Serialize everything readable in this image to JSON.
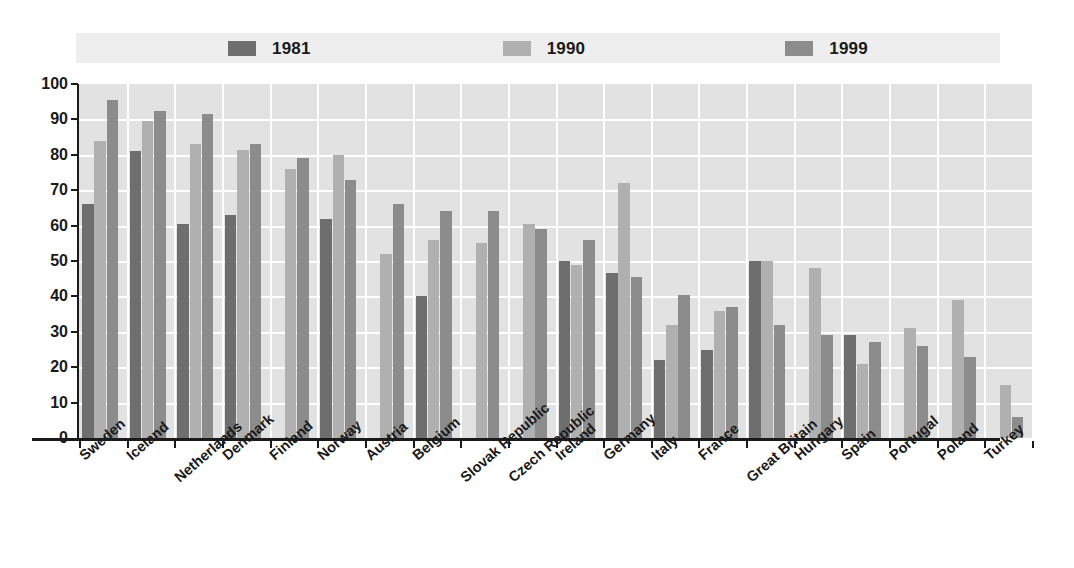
{
  "chart_data": {
    "type": "bar",
    "title": "",
    "subtitle": "",
    "xlabel": "",
    "ylabel": "",
    "ylim": [
      0,
      100
    ],
    "ytick_step": 10,
    "yticks": [
      0,
      10,
      20,
      30,
      40,
      50,
      60,
      70,
      80,
      90,
      100
    ],
    "grid": true,
    "legend_position": "top",
    "categories": [
      "Sweden",
      "Iceland",
      "Netherlands",
      "Denmark",
      "Finland",
      "Norway",
      "Austria",
      "Belgium",
      "Slovak Republic",
      "Czech Republic",
      "Ireland",
      "Germany",
      "Italy",
      "France",
      "Great Britain",
      "Hungary",
      "Spain",
      "Portugal",
      "Poland",
      "Turkey"
    ],
    "series": [
      {
        "name": "1981",
        "color": "#6e6e6e",
        "values": [
          66,
          81,
          60.5,
          63,
          null,
          62,
          null,
          40,
          null,
          null,
          50,
          46.5,
          22,
          25,
          50,
          null,
          29,
          null,
          null,
          null
        ]
      },
      {
        "name": "1990",
        "color": "#b0b0b0",
        "values": [
          84,
          89.5,
          83,
          81.5,
          76,
          80,
          52,
          56,
          55,
          60.5,
          49,
          72,
          32,
          36,
          50,
          48,
          21,
          31,
          39,
          15
        ]
      },
      {
        "name": "1999",
        "color": "#8c8c8c",
        "values": [
          95.5,
          92.5,
          91.5,
          83,
          79,
          73,
          66,
          64,
          64,
          59,
          56,
          45.5,
          40.5,
          37,
          32,
          29,
          27,
          26,
          23,
          6
        ]
      }
    ]
  },
  "legend": {
    "items": [
      {
        "label": "1981",
        "color": "#6e6e6e"
      },
      {
        "label": "1990",
        "color": "#b0b0b0"
      },
      {
        "label": "1999",
        "color": "#8c8c8c"
      }
    ],
    "background": "#eeeeee"
  },
  "axes": {
    "y_ticks": [
      "100",
      "90",
      "80",
      "70",
      "60",
      "50",
      "40",
      "30",
      "20",
      "10",
      "0"
    ],
    "plot_background": "#e2e2e2",
    "gridline_color": "#ffffff",
    "axis_color": "#1a1a1a"
  }
}
